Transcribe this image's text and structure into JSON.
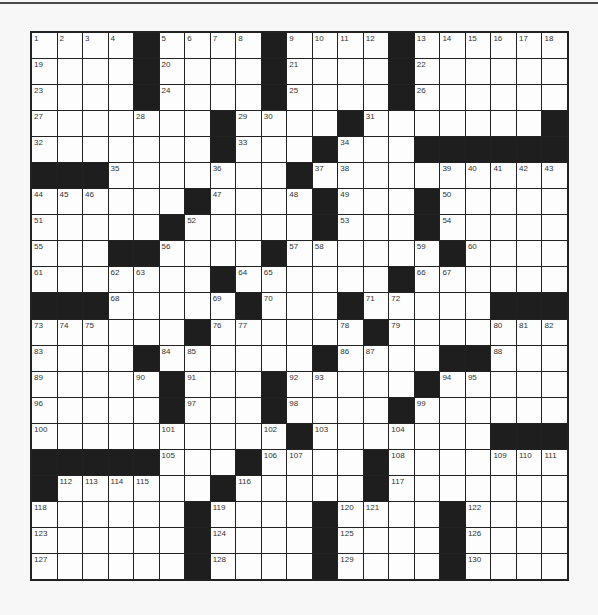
{
  "puzzle": {
    "rows": 21,
    "cols": 21,
    "grid": [
      "1,2,3,4,#,5,6,7,8,#,9,10,11,12,#,13,14,15,16,17,18",
      "19,.,.,.,#,20,.,.,.,#,21,.,.,.,#,22,.,.,.,.,.",
      "23,.,.,.,#,24,.,.,.,#,25,.,.,.,#,26,.,.,.,.,.",
      "27,.,.,.,28,.,.,#,29,30,.,.,#,31,.,.,.,.,.,.,#",
      "32,.,.,.,.,.,.,#,33,.,.,#,34,.,.,#,#,#,#,#,#",
      "#,#,#,35,.,.,.,36,.,.,#,37,38,.,.,.,39,40,41,42,43",
      "44,45,46,.,.,.,#,47,.,.,48,#,49,.,.,#,50,.,.,.,.",
      "51,.,.,.,.,#,52,.,.,.,.,#,53,.,.,#,54,.,.,.,.",
      "55,.,.,#,#,56,.,.,.,#,57,58,.,.,.,59,#,60,.,.,.",
      "61,.,.,62,63,.,.,#,64,65,.,.,.,.,#,66,67,.,.,.,.",
      "#,#,#,68,.,.,.,69,#,70,.,.,#,71,72,.,.,.,#,#,#",
      "73,74,75,.,.,.,#,76,77,.,.,.,78,#,79,.,.,.,80,81,82",
      "83,.,.,.,#,84,85,.,.,.,.,#,86,87,.,.,#,#,88,.,.",
      "89,.,.,.,90,#,91,.,.,#,92,93,.,.,.,#,94,95,.,.,.",
      "96,.,.,.,.,#,97,.,.,#,98,.,.,.,#,99,.,.,.,.,.",
      "100,.,.,.,.,101,.,.,.,102,#,103,.,.,104,.,.,.,#,#,#",
      "#,#,#,#,#,105,.,.,#,106,107,.,.,#,108,.,.,.,109,110,111",
      "#,112,113,114,115,.,.,#,116,.,.,.,.,#,117,.,.,.,.,.,.",
      "118,.,.,.,.,.,#,119,.,.,.,#,120,121,.,.,#,122,.,.,.",
      "123,.,.,.,.,.,#,124,.,.,.,#,125,.,.,.,#,126,.,.,.",
      "127,.,.,.,.,.,#,128,.,.,.,#,129,.,.,.,#,130,.,.,."
    ]
  },
  "colors": {
    "background": "#f7f7f7",
    "cell": "#fdfdfd",
    "block": "#1e1e1e",
    "gridline": "#222222"
  }
}
